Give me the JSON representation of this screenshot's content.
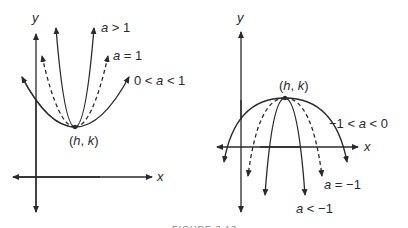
{
  "figure": {
    "caption": "FIGURE 3.13",
    "left_panel": {
      "axis_x_label": "x",
      "axis_y_label": "y",
      "vertex_label": "(h, k)",
      "curves": [
        {
          "label": "a > 1",
          "style": "solid",
          "description": "narrow upward parabola"
        },
        {
          "label": "a = 1",
          "style": "dashed",
          "description": "standard upward parabola"
        },
        {
          "label": "0 < a < 1",
          "style": "solid",
          "description": "wide upward parabola"
        }
      ]
    },
    "right_panel": {
      "axis_x_label": "x",
      "axis_y_label": "y",
      "vertex_label": "(h, k)",
      "curves": [
        {
          "label": "-1 < a < 0",
          "style": "solid",
          "description": "wide downward parabola"
        },
        {
          "label": "a = -1",
          "style": "dashed",
          "description": "standard downward parabola"
        },
        {
          "label": "a < -1",
          "style": "solid",
          "description": "narrow downward parabola"
        }
      ]
    }
  },
  "labels": {
    "left_a_gt_1": "a > 1",
    "left_a_eq_1": "a = 1",
    "left_0_lt_a_lt_1": "0 < a < 1",
    "left_vertex": "(h, k)",
    "left_x": "x",
    "left_y": "y",
    "right_neg1_lt_a_lt_0": "−1 < a < 0",
    "right_a_eq_neg1": "a = −1",
    "right_a_lt_neg1": "a < −1",
    "right_vertex": "(h, k)",
    "right_x": "x",
    "right_y": "y",
    "caption": "FIGURE 3.13"
  }
}
